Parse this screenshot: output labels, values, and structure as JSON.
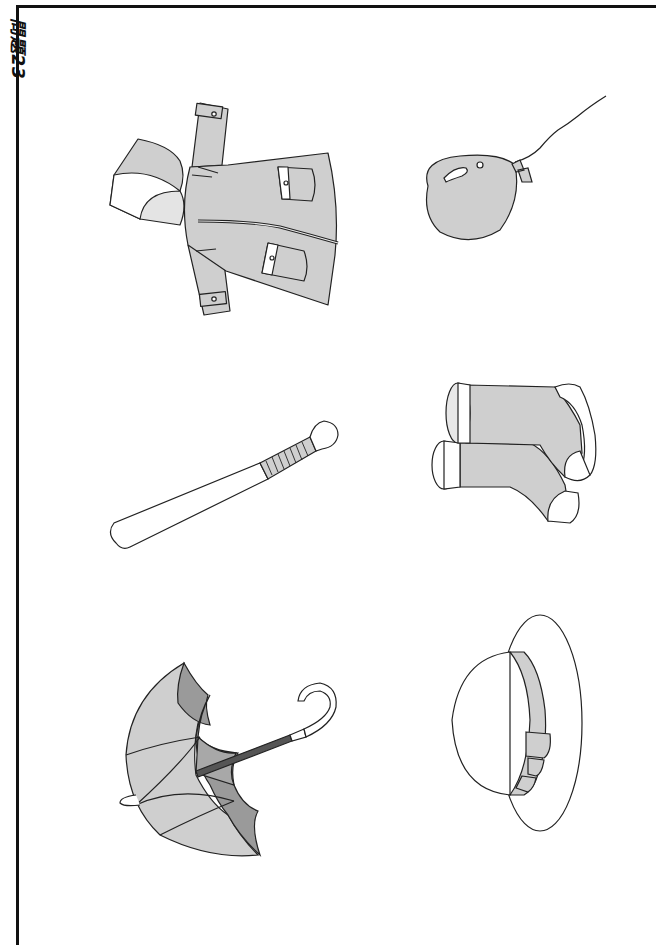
{
  "page": {
    "side_label": "問題23",
    "orientation": "rotated 90deg"
  },
  "colors": {
    "frame": "#111111",
    "fill_light": "#cfcfcf",
    "fill_mid": "#bdbdbd",
    "fill_dark": "#9a9a9a",
    "shaft": "#555555",
    "stroke": "#222222",
    "background": "#ffffff"
  },
  "items": [
    {
      "id": "raincoat",
      "label": "raincoat",
      "row": 1,
      "col": 1
    },
    {
      "id": "balloon",
      "label": "balloon",
      "row": 1,
      "col": 2
    },
    {
      "id": "baseball-bat",
      "label": "baseball bat",
      "row": 2,
      "col": 1
    },
    {
      "id": "rain-boots",
      "label": "rain boots",
      "row": 2,
      "col": 2
    },
    {
      "id": "umbrella",
      "label": "umbrella",
      "row": 3,
      "col": 1
    },
    {
      "id": "hat",
      "label": "hat",
      "row": 3,
      "col": 2
    }
  ]
}
